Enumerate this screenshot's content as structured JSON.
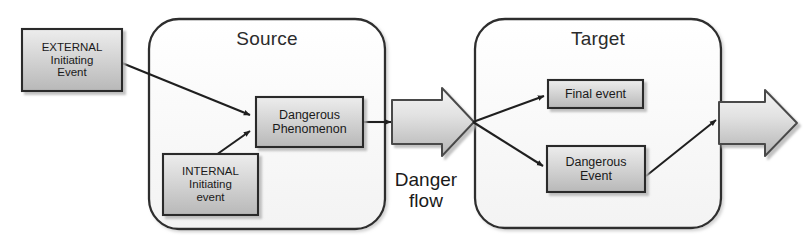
{
  "diagram": {
    "type": "block-flow-diagram",
    "colors": {
      "box_fill_light": "#f2f2f2",
      "box_fill_dark": "#c9c9c9",
      "box_stroke": "#2b2b2b",
      "container_fill": "#fbfbfb",
      "container_stroke": "#2f2f2f",
      "arrow_stroke": "#1f1f1f",
      "block_arrow_fill_light": "#efefef",
      "block_arrow_fill_dark": "#bdbdbd",
      "text": "#1a1a1a",
      "background": "#ffffff"
    },
    "containers": [
      {
        "id": "source",
        "title": "Source"
      },
      {
        "id": "target",
        "title": "Target"
      }
    ],
    "nodes": [
      {
        "id": "external-initiating-event",
        "label": "EXTERNAL\nInitiating\nEvent"
      },
      {
        "id": "internal-initiating-event",
        "label": "INTERNAL\nInitiating\nevent"
      },
      {
        "id": "dangerous-phenomenon",
        "label": "Dangerous\nPhenomenon"
      },
      {
        "id": "final-event",
        "label": "Final event"
      },
      {
        "id": "dangerous-event",
        "label": "Dangerous\nEvent"
      }
    ],
    "captions": [
      {
        "id": "danger-flow",
        "label": "Danger\nflow"
      }
    ],
    "connectors": [
      {
        "id": "external-to-phenomenon",
        "from": "external-initiating-event",
        "to": "dangerous-phenomenon",
        "style": "arrow"
      },
      {
        "id": "internal-to-phenomenon",
        "from": "internal-initiating-event",
        "to": "dangerous-phenomenon",
        "style": "arrow"
      },
      {
        "id": "phenomenon-to-danger-flow",
        "from": "dangerous-phenomenon",
        "to": "danger-flow-arrow",
        "style": "arrow"
      },
      {
        "id": "dangerflow-to-final-event",
        "from": "danger-flow-arrow",
        "to": "final-event",
        "style": "arrow"
      },
      {
        "id": "dangerflow-to-dangerous-event",
        "from": "danger-flow-arrow",
        "to": "dangerous-event",
        "style": "arrow"
      },
      {
        "id": "dangerous-event-to-output",
        "from": "dangerous-event",
        "to": "output-arrow",
        "style": "arrow"
      }
    ],
    "block_arrows": [
      {
        "id": "danger-flow-arrow",
        "direction": "right"
      },
      {
        "id": "output-arrow",
        "direction": "right"
      }
    ]
  }
}
